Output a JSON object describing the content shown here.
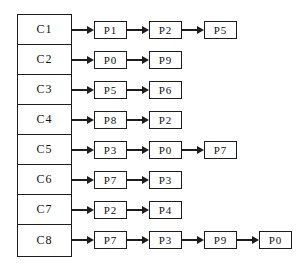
{
  "diagram": {
    "rows": [
      {
        "label": "C1",
        "chain": [
          "P1",
          "P2",
          "P5"
        ]
      },
      {
        "label": "C2",
        "chain": [
          "P0",
          "P9"
        ]
      },
      {
        "label": "C3",
        "chain": [
          "P5",
          "P6"
        ]
      },
      {
        "label": "C4",
        "chain": [
          "P8",
          "P2"
        ]
      },
      {
        "label": "C5",
        "chain": [
          "P3",
          "P0",
          "P7"
        ]
      },
      {
        "label": "C6",
        "chain": [
          "P7",
          "P3"
        ]
      },
      {
        "label": "C7",
        "chain": [
          "P2",
          "P4"
        ]
      },
      {
        "label": "C8",
        "chain": [
          "P7",
          "P3",
          "P9",
          "P0"
        ]
      }
    ],
    "colors": {
      "line": "#1d1d1d",
      "background": "#ffffff",
      "node_fill": "#ffffff",
      "text": "#111111"
    }
  }
}
